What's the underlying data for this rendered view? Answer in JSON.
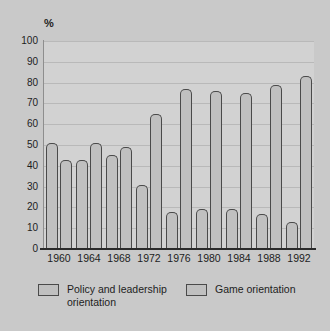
{
  "chart_data": {
    "type": "bar",
    "title": "",
    "subtitle": "",
    "xlabel": "",
    "ylabel": "%",
    "ylim": [
      0,
      100
    ],
    "ytick_step": 10,
    "yticks": [
      "100",
      "90",
      "80",
      "70",
      "60",
      "50",
      "40",
      "30",
      "20",
      "10",
      "0"
    ],
    "grid": true,
    "legend_position": "bottom",
    "categories": [
      "1960",
      "1964",
      "1968",
      "1972",
      "1976",
      "1980",
      "1984",
      "1988",
      "1992"
    ],
    "series": [
      {
        "name": "Policy and leadership orientation",
        "legend_line1": "Policy and leadership",
        "legend_line2": "orientation",
        "color": "#c0c0c0",
        "values": [
          51,
          43,
          45,
          31,
          18,
          19,
          19,
          17,
          13
        ]
      },
      {
        "name": "Game orientation",
        "legend_line1": "Game orientation",
        "legend_line2": "",
        "color": "#c0c0c0",
        "values": [
          43,
          51,
          49,
          65,
          77,
          76,
          75,
          79,
          83
        ]
      }
    ]
  },
  "colors": {
    "background": "#c9c9c9",
    "plot_background": "#d2d2d2",
    "bar_fill": "#c0c0c0",
    "bar_edge": "#4a4a4a",
    "gridline": "#b9b9b9",
    "axis": "#2a2a2a",
    "text": "#1d1d1d"
  }
}
